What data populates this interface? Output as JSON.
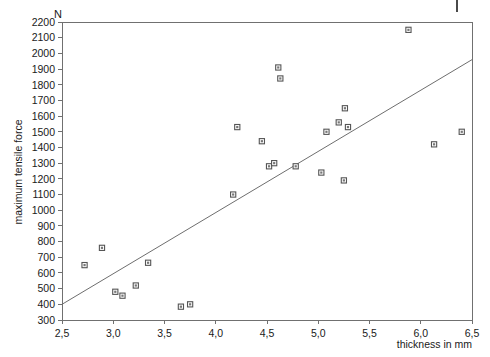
{
  "chart_data": {
    "type": "scatter",
    "title": "",
    "xlabel": "thickness in mm",
    "ylabel": "maximum tensile force",
    "yunit": "N",
    "xlim": [
      2.5,
      6.5
    ],
    "ylim": [
      300,
      2200
    ],
    "xticks": [
      "2,5",
      "3,0",
      "3,5",
      "4,0",
      "4,5",
      "5,0",
      "5,5",
      "6,0",
      "6,5"
    ],
    "xtick_values": [
      2.5,
      3.0,
      3.5,
      4.0,
      4.5,
      5.0,
      5.5,
      6.0,
      6.5
    ],
    "yticks": [
      "300",
      "400",
      "500",
      "600",
      "700",
      "800",
      "900",
      "1000",
      "1100",
      "1200",
      "1300",
      "1400",
      "1500",
      "1600",
      "1700",
      "1800",
      "1900",
      "2000",
      "2100",
      "2200"
    ],
    "ytick_values": [
      300,
      400,
      500,
      600,
      700,
      800,
      900,
      1000,
      1100,
      1200,
      1300,
      1400,
      1500,
      1600,
      1700,
      1800,
      1900,
      2000,
      2100,
      2200
    ],
    "grid": false,
    "legend": "none",
    "marker_style": "open-square",
    "points": [
      {
        "x": 2.72,
        "y": 650
      },
      {
        "x": 2.89,
        "y": 760
      },
      {
        "x": 3.02,
        "y": 480
      },
      {
        "x": 3.09,
        "y": 455
      },
      {
        "x": 3.22,
        "y": 520
      },
      {
        "x": 3.34,
        "y": 665
      },
      {
        "x": 3.66,
        "y": 385
      },
      {
        "x": 3.75,
        "y": 400
      },
      {
        "x": 4.17,
        "y": 1100
      },
      {
        "x": 4.21,
        "y": 1530
      },
      {
        "x": 4.45,
        "y": 1440
      },
      {
        "x": 4.52,
        "y": 1280
      },
      {
        "x": 4.57,
        "y": 1300
      },
      {
        "x": 4.61,
        "y": 1910
      },
      {
        "x": 4.63,
        "y": 1840
      },
      {
        "x": 4.78,
        "y": 1280
      },
      {
        "x": 5.03,
        "y": 1240
      },
      {
        "x": 5.08,
        "y": 1500
      },
      {
        "x": 5.2,
        "y": 1560
      },
      {
        "x": 5.26,
        "y": 1650
      },
      {
        "x": 5.25,
        "y": 1190
      },
      {
        "x": 5.29,
        "y": 1530
      },
      {
        "x": 5.88,
        "y": 2150
      },
      {
        "x": 6.13,
        "y": 1420
      },
      {
        "x": 6.4,
        "y": 1500
      }
    ],
    "fit_line": {
      "label": "regression line",
      "x1": 2.5,
      "y1": 400,
      "x2": 6.5,
      "y2": 1960
    }
  },
  "figure": {
    "corner_mark": "|"
  }
}
